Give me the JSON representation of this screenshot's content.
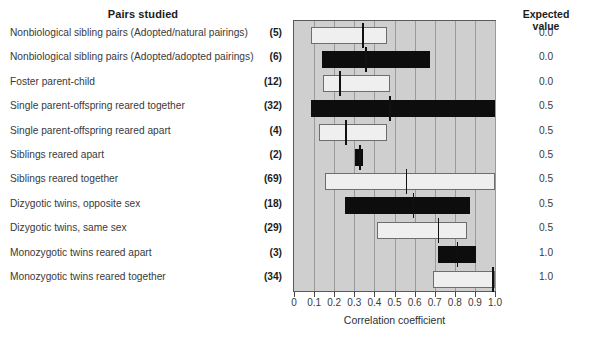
{
  "headers": {
    "pairs_studied": "Pairs studied",
    "expected_value_line1": "Expected",
    "expected_value_line2": "value"
  },
  "axis": {
    "title": "Correlation coefficient",
    "ticklabels": [
      "0",
      "0.1",
      "0.2",
      "0.3",
      "0.4",
      "0.5",
      "0.6",
      "0.7",
      "0.8",
      "0.9",
      "1.0"
    ]
  },
  "chart_data": {
    "type": "bar",
    "title": "Pairs studied",
    "xlabel": "Correlation coefficient",
    "ylabel": "",
    "xlim": [
      0.0,
      1.0
    ],
    "grid": true,
    "legend": "none",
    "orientation": "horizontal",
    "note": "Range bars (min-max of reported correlations) with a vertical median/mean marker; fill colour alternates white (open) and black (filled).",
    "categories": [
      "Nonbiological sibling pairs (Adopted/natural pairings)",
      "Nonbiological sibling pairs (Adopted/adopted pairings)",
      "Foster parent-child",
      "Single parent-offspring reared together",
      "Single parent-offspring reared apart",
      "Siblings reared apart",
      "Siblings reared together",
      "Dizygotic twins, opposite sex",
      "Dizygotic twins, same sex",
      "Monozygotic twins reared apart",
      "Monozygotic twins reared together"
    ],
    "counts": [
      "(5)",
      "(6)",
      "(12)",
      "(32)",
      "(4)",
      "(2)",
      "(69)",
      "(18)",
      "(29)",
      "(3)",
      "(34)"
    ],
    "expected_values": [
      "0.0",
      "0.0",
      "0.0",
      "0.5",
      "0.5",
      "0.5",
      "0.5",
      "0.5",
      "0.5",
      "1.0",
      "1.0"
    ],
    "bars": [
      {
        "category": "Nonbiological sibling pairs (Adopted/natural pairings)",
        "count": 5,
        "low": 0.085,
        "high": 0.465,
        "median": 0.34,
        "fill": "white",
        "expected": 0.0
      },
      {
        "category": "Nonbiological sibling pairs (Adopted/adopted pairings)",
        "count": 6,
        "low": 0.14,
        "high": 0.675,
        "median": 0.355,
        "fill": "black",
        "expected": 0.0
      },
      {
        "category": "Foster parent-child",
        "count": 12,
        "low": 0.145,
        "high": 0.48,
        "median": 0.225,
        "fill": "white",
        "expected": 0.0
      },
      {
        "category": "Single parent-offspring reared together",
        "count": 32,
        "low": 0.085,
        "high": 1.0,
        "median": 0.475,
        "fill": "black",
        "expected": 0.5
      },
      {
        "category": "Single parent-offspring reared apart",
        "count": 4,
        "low": 0.125,
        "high": 0.465,
        "median": 0.255,
        "fill": "white",
        "expected": 0.5
      },
      {
        "category": "Siblings reared apart",
        "count": 2,
        "low": 0.305,
        "high": 0.345,
        "median": 0.325,
        "fill": "black",
        "expected": 0.5
      },
      {
        "category": "Siblings reared together",
        "count": 69,
        "low": 0.155,
        "high": 1.0,
        "median": 0.555,
        "fill": "white",
        "expected": 0.5
      },
      {
        "category": "Dizygotic twins, opposite sex",
        "count": 18,
        "low": 0.255,
        "high": 0.875,
        "median": 0.59,
        "fill": "black",
        "expected": 0.5
      },
      {
        "category": "Dizygotic twins, same sex",
        "count": 29,
        "low": 0.415,
        "high": 0.86,
        "median": 0.715,
        "fill": "white",
        "expected": 0.5
      },
      {
        "category": "Monozygotic twins reared apart",
        "count": 3,
        "low": 0.715,
        "high": 0.905,
        "median": 0.81,
        "fill": "black",
        "expected": 1.0
      },
      {
        "category": "Monozygotic twins reared together",
        "count": 34,
        "low": 0.69,
        "high": 1.0,
        "median": 0.985,
        "fill": "white",
        "expected": 1.0
      }
    ]
  }
}
